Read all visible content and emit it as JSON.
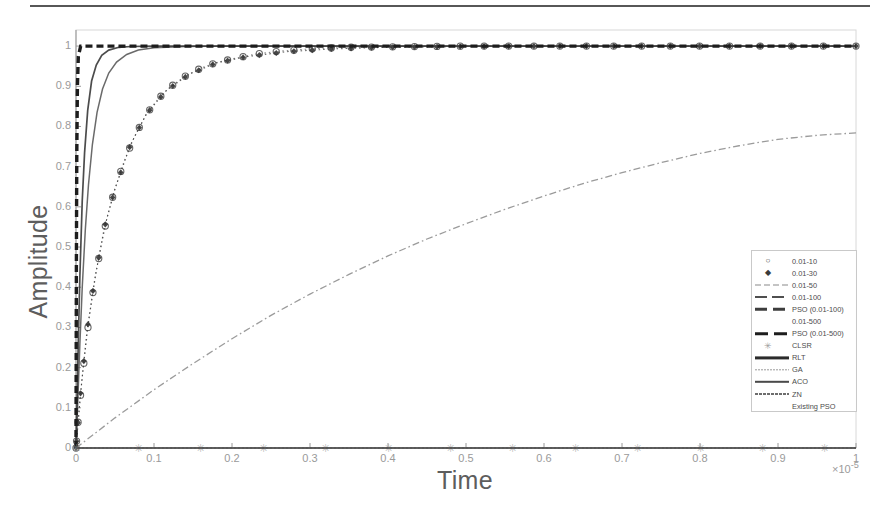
{
  "chart_data": {
    "type": "line",
    "title": "",
    "xlabel": "Time",
    "ylabel": "Amplitude",
    "xlim": [
      0,
      1
    ],
    "ylim": [
      0,
      1.04
    ],
    "x_exponent": "×10",
    "x_exponent_sup": "-5",
    "grid": false,
    "legend_position": "right-center",
    "xticks": [
      "0",
      "0.1",
      "0.2",
      "0.3",
      "0.4",
      "0.5",
      "0.6",
      "0.7",
      "0.8",
      "0.9",
      "1"
    ],
    "xtick_values": [
      0,
      0.1,
      0.2,
      0.3,
      0.4,
      0.5,
      0.6,
      0.7,
      0.8,
      0.9,
      1
    ],
    "yticks": [
      "0",
      "0.1",
      "0.2",
      "0.3",
      "0.4",
      "0.5",
      "0.6",
      "0.7",
      "0.8",
      "0.9",
      "1"
    ],
    "ytick_values": [
      0,
      0.1,
      0.2,
      0.3,
      0.4,
      0.5,
      0.6,
      0.7,
      0.8,
      0.9,
      1
    ],
    "series": [
      {
        "name": "0.01-10",
        "style": "marker-circle",
        "color": "#555555",
        "comment": "first-order step response, slowest of the settling group; reaches 0.98 near x=0.30",
        "x": [
          0,
          0.004,
          0.008,
          0.012,
          0.016,
          0.02,
          0.026,
          0.032,
          0.04,
          0.05,
          0.062,
          0.075,
          0.09,
          0.105,
          0.12,
          0.14,
          0.16,
          0.18,
          0.2,
          0.23,
          0.26,
          0.3,
          0.35,
          0.4,
          0.45,
          0.5,
          0.55,
          0.6,
          0.65,
          0.7,
          0.75,
          0.8,
          0.85,
          0.9,
          0.95,
          1.0
        ],
        "y": [
          0,
          0.095,
          0.175,
          0.245,
          0.31,
          0.365,
          0.44,
          0.5,
          0.575,
          0.645,
          0.715,
          0.775,
          0.83,
          0.868,
          0.897,
          0.925,
          0.945,
          0.959,
          0.968,
          0.98,
          0.987,
          0.993,
          0.997,
          0.998,
          0.999,
          1.0,
          1.0,
          1.0,
          1.0,
          1.0,
          1.0,
          1.0,
          1.0,
          1.0,
          1.0,
          1.0
        ]
      },
      {
        "name": "0.01-30",
        "style": "marker-diamond",
        "color": "#333333",
        "comment": "overlaps the 0.01-10 marker trace",
        "x": [
          0,
          0.006,
          0.014,
          0.024,
          0.036,
          0.05,
          0.07,
          0.09,
          0.115,
          0.145,
          0.18,
          0.22,
          0.27,
          0.33,
          0.4,
          0.5,
          0.62,
          0.75,
          0.88,
          1.0
        ],
        "y": [
          0,
          0.14,
          0.29,
          0.42,
          0.545,
          0.645,
          0.755,
          0.83,
          0.888,
          0.93,
          0.958,
          0.974,
          0.986,
          0.993,
          0.997,
          0.999,
          1.0,
          1.0,
          1.0,
          1.0
        ]
      },
      {
        "name": "0.01-50",
        "style": "dashdot-thin",
        "color": "#8a8a8a",
        "comment": "slow rising dash-dot curve, only reaches about 0.78 at x=1",
        "x": [
          0,
          0.05,
          0.1,
          0.15,
          0.2,
          0.25,
          0.3,
          0.35,
          0.4,
          0.45,
          0.5,
          0.55,
          0.6,
          0.65,
          0.7,
          0.75,
          0.8,
          0.85,
          0.9,
          0.95,
          1.0
        ],
        "y": [
          0,
          0.075,
          0.145,
          0.21,
          0.272,
          0.33,
          0.383,
          0.432,
          0.478,
          0.52,
          0.558,
          0.594,
          0.627,
          0.658,
          0.685,
          0.71,
          0.733,
          0.752,
          0.768,
          0.778,
          0.784
        ]
      },
      {
        "name": "0.01-100",
        "style": "dashed-medium",
        "color": "#5a5a5a",
        "comment": "fast solid-looking rise, settles at 1 by x~0.06",
        "x": [
          0,
          0.002,
          0.005,
          0.008,
          0.012,
          0.016,
          0.021,
          0.027,
          0.034,
          0.042,
          0.052,
          0.065,
          0.08,
          0.1,
          0.14,
          0.2,
          0.35,
          0.6,
          1.0
        ],
        "y": [
          0,
          0.1,
          0.26,
          0.4,
          0.545,
          0.655,
          0.755,
          0.835,
          0.893,
          0.933,
          0.96,
          0.979,
          0.99,
          0.996,
          0.999,
          1.0,
          1.0,
          1.0,
          1.0
        ]
      },
      {
        "name": "PSO (0.01-100)",
        "style": "dashed-thick",
        "color": "#3d3d3d",
        "comment": "very fast rise, settles at 1 by x~0.03",
        "x": [
          0,
          0.001,
          0.003,
          0.005,
          0.008,
          0.011,
          0.015,
          0.02,
          0.026,
          0.033,
          0.042,
          0.055,
          0.07,
          0.1,
          0.18,
          0.4,
          1.0
        ],
        "y": [
          0,
          0.09,
          0.27,
          0.43,
          0.615,
          0.735,
          0.84,
          0.913,
          0.953,
          0.977,
          0.99,
          0.997,
          0.999,
          1.0,
          1.0,
          1.0,
          1.0
        ]
      },
      {
        "name": "0.01-500",
        "style": "none",
        "color": "#666666",
        "comment": "no visible sample line in the legend",
        "x": [],
        "y": []
      },
      {
        "name": "PSO (0.01-500)",
        "style": "dashed-heavy",
        "color": "#1d1d1d",
        "comment": "near-vertical heavy dashed step at x=0 rising straight to 1",
        "x": [
          0,
          0.0005,
          0.001,
          0.0018,
          0.003,
          0.006,
          1.0
        ],
        "y": [
          0,
          0.46,
          0.73,
          0.9,
          0.975,
          1.0,
          1.0
        ]
      },
      {
        "name": "CLSR",
        "style": "marker-star",
        "color": "#9c9c9c",
        "comment": "flat series sitting on the baseline at y=0",
        "x": [
          0,
          0.08,
          0.16,
          0.24,
          0.32,
          0.4,
          0.48,
          0.56,
          0.64,
          0.72,
          0.8,
          0.88,
          0.96
        ],
        "y": [
          0,
          0,
          0,
          0,
          0,
          0,
          0,
          0,
          0,
          0,
          0,
          0,
          0
        ]
      },
      {
        "name": "RLT",
        "style": "solid-heavy",
        "color": "#2b2b2b",
        "comment": "coincident with the baseline",
        "x": [
          0,
          1.0
        ],
        "y": [
          0,
          0
        ]
      },
      {
        "name": "GA",
        "style": "solid-light",
        "color": "#9a9a9a",
        "comment": "coincident with the baseline",
        "x": [
          0,
          1.0
        ],
        "y": [
          0,
          0
        ]
      },
      {
        "name": "ACO",
        "style": "solid-medium",
        "color": "#4a4a4a",
        "comment": "coincident with the baseline",
        "x": [
          0,
          1.0
        ],
        "y": [
          0,
          0
        ]
      },
      {
        "name": "ZN",
        "style": "solid-dotted",
        "color": "#6d6d6d",
        "comment": "coincident with the baseline",
        "x": [
          0,
          1.0
        ],
        "y": [
          0,
          0
        ]
      },
      {
        "name": "Existing PSO",
        "style": "none",
        "color": "#777777",
        "comment": "no visible sample line in the legend",
        "x": [],
        "y": []
      }
    ]
  },
  "legend": {
    "entries": [
      {
        "label": "0.01-10",
        "sample": "marker-circle"
      },
      {
        "label": "0.01-30",
        "sample": "marker-diamond"
      },
      {
        "label": "0.01-50",
        "sample": "dashdot-thin"
      },
      {
        "label": "0.01-100",
        "sample": "dashed-medium"
      },
      {
        "label": "PSO (0.01-100)",
        "sample": "dashed-thick"
      },
      {
        "label": "0.01-500",
        "sample": "none"
      },
      {
        "label": "PSO (0.01-500)",
        "sample": "dashed-heavy"
      },
      {
        "label": "CLSR",
        "sample": "marker-star"
      },
      {
        "label": "RLT",
        "sample": "solid-heavy"
      },
      {
        "label": "GA",
        "sample": "solid-light"
      },
      {
        "label": "ACO",
        "sample": "solid-medium"
      },
      {
        "label": "ZN",
        "sample": "solid-dotted"
      },
      {
        "label": "Existing PSO",
        "sample": "none"
      }
    ]
  },
  "colors": {
    "axis": "#9a9a9a",
    "tick_text": "#9a9a9a",
    "axis_label": "#5d5d5d",
    "legend_border": "#c9c9c9",
    "page_rule": "#3a3a3a"
  }
}
